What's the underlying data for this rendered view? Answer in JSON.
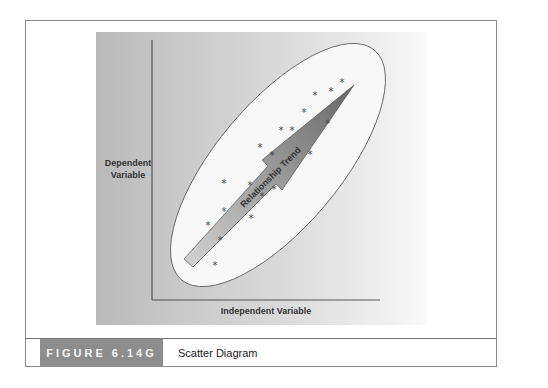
{
  "figure": {
    "tag": "FIGURE 6.14G",
    "title": "Scatter Diagram"
  },
  "axes": {
    "y_label_line1": "Dependent",
    "y_label_line2": "Variable",
    "x_label": "Independent Variable"
  },
  "arrow": {
    "label": "Relationship Trend",
    "colors": {
      "tail": "#c8c8c8",
      "head": "#6f6f6f"
    }
  },
  "colors": {
    "panel": "#c4c4c4",
    "ellipse_fill": "#f7f7f7",
    "caption_tag": "#8d8d8d",
    "frame_border": "#8a8a8a"
  },
  "chart_data": {
    "type": "scatter",
    "title": "Scatter Diagram",
    "xlabel": "Independent Variable",
    "ylabel": "Dependent Variable",
    "grid": false,
    "annotations": [
      "Relationship Trend"
    ],
    "marker": "*",
    "points_px": [
      [
        342,
        82
      ],
      [
        331,
        91
      ],
      [
        315,
        95
      ],
      [
        304,
        112
      ],
      [
        328,
        123
      ],
      [
        281,
        130
      ],
      [
        292,
        130
      ],
      [
        260,
        147
      ],
      [
        310,
        154
      ],
      [
        272,
        155
      ],
      [
        224,
        183
      ],
      [
        250,
        185
      ],
      [
        274,
        189
      ],
      [
        262,
        196
      ],
      [
        224,
        211
      ],
      [
        251,
        218
      ],
      [
        208,
        225
      ],
      [
        220,
        240
      ],
      [
        215,
        265
      ]
    ]
  }
}
